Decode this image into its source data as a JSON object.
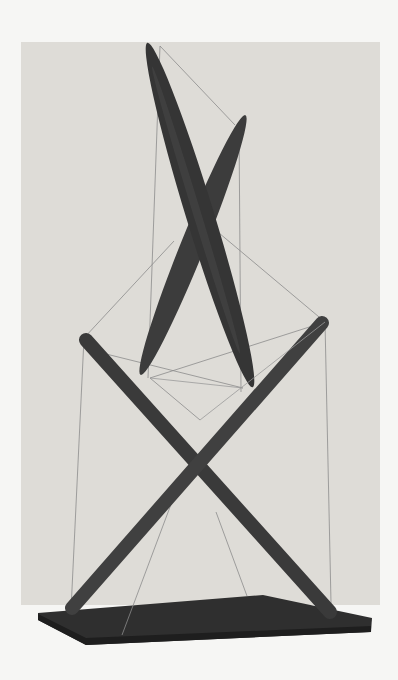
{
  "image": {
    "description": "Black-and-white photograph of a tensegrity sculpture: two pairs of crossed dark wooden struts held in tension by thin wires above a flat dark base",
    "background_color": "#f6f6f4",
    "backdrop_color": "#dedcd7",
    "strut_color": "#3a3a3a",
    "wire_color": "#8a8a8a",
    "base_color": "#2f2f2f"
  }
}
